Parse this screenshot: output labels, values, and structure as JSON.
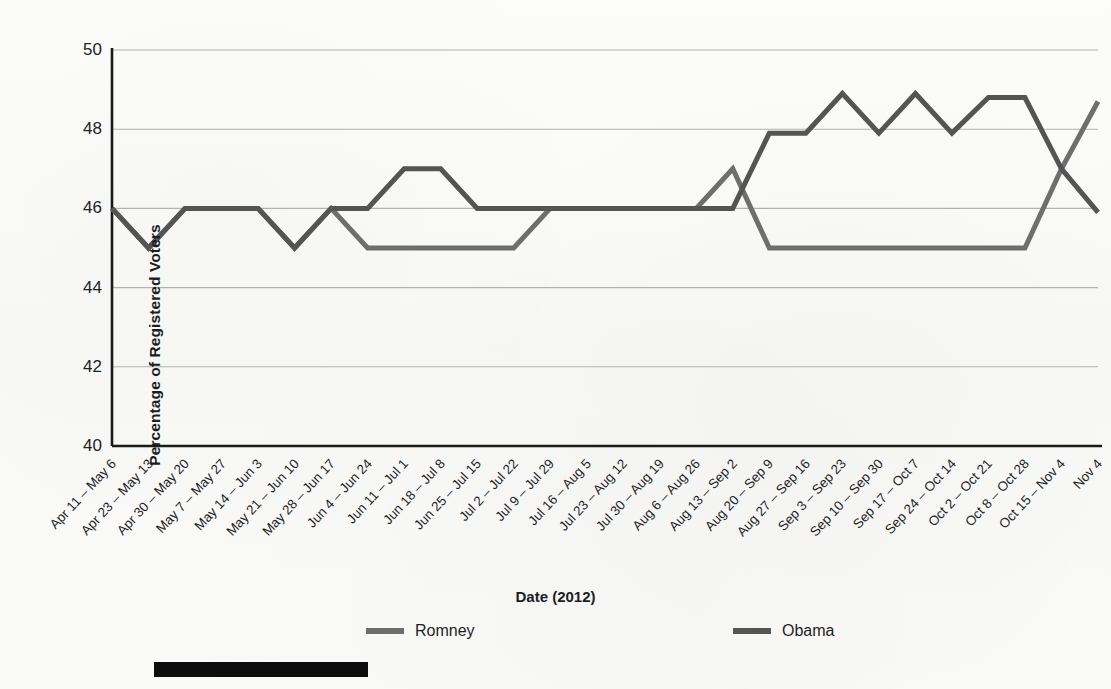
{
  "chart_data": {
    "type": "line",
    "title": "",
    "xlabel": "Date (2012)",
    "ylabel": "Percentage of Registered Voters",
    "ylim": [
      40,
      50
    ],
    "yticks": [
      40,
      42,
      44,
      46,
      48,
      50
    ],
    "grid": true,
    "legend_position": "bottom",
    "categories": [
      "Apr 11 – May 6",
      "Apr 23 – May 13",
      "Apr 30 – May 20",
      "May 7 – May 27",
      "May 14 – Jun 3",
      "May 21 – Jun 10",
      "May 28 – Jun 17",
      "Jun 4 – Jun 24",
      "Jun 11 – Jul 1",
      "Jun 18 – Jul 8",
      "Jun 25 – Jul 15",
      "Jul 2 – Jul 22",
      "Jul 9 – Jul 29",
      "Jul 16 – Aug 5",
      "Jul 23 – Aug 12",
      "Jul 30 – Aug 19",
      "Aug 6 – Aug 26",
      "Aug 13 – Sep 2",
      "Aug 20 – Sep 9",
      "Aug 27 – Sep 16",
      "Sep 3 – Sep 23",
      "Sep 10 – Sep 30",
      "Sep 17 – Oct 7",
      "Sep 24 – Oct 14",
      "Oct 2 – Oct 21",
      "Oct 8 – Oct 28",
      "Oct 15 – Nov 4",
      "Nov 4"
    ],
    "series": [
      {
        "name": "Romney",
        "color": "#6e6e6e",
        "values": [
          46,
          45,
          46,
          46,
          46,
          45,
          46,
          45,
          45,
          45,
          45,
          45,
          46,
          46,
          46,
          46,
          46,
          47,
          45,
          45,
          45,
          45,
          45,
          45,
          45,
          45,
          47,
          48.7
        ]
      },
      {
        "name": "Obama",
        "color": "#545454",
        "values": [
          46,
          45,
          46,
          46,
          46,
          45,
          46,
          46,
          47,
          47,
          46,
          46,
          46,
          46,
          46,
          46,
          46,
          46,
          47.9,
          47.9,
          48.9,
          47.9,
          48.9,
          47.9,
          48.8,
          48.8,
          47,
          45.9
        ]
      }
    ]
  },
  "legend": {
    "items": [
      {
        "label": "Romney",
        "color": "#6e6e6e"
      },
      {
        "label": "Obama",
        "color": "#545454"
      }
    ]
  },
  "annotations": {
    "redaction_bar": "redacted-black-bar"
  },
  "colors": {
    "axis": "#1a1a1a",
    "grid": "#9a9a9a",
    "text": "#1f1f1f",
    "romney": "#6e6e6e",
    "obama": "#545454",
    "redaction": "#0d0d0d"
  }
}
